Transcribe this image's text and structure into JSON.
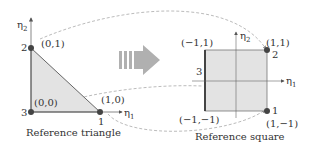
{
  "triangle": {
    "caption": "Reference triangle",
    "axis_x": "η",
    "axis_x_sub": "1",
    "axis_y": "η",
    "axis_y_sub": "2",
    "nodes": [
      {
        "id": "1",
        "coord": "(1,0)"
      },
      {
        "id": "2",
        "coord": "(0,1)"
      },
      {
        "id": "3",
        "coord": "(0,0)"
      }
    ]
  },
  "square": {
    "caption": "Reference square",
    "axis_x": "η",
    "axis_x_sub": "1",
    "axis_y": "η",
    "axis_y_sub": "2",
    "nodes": [
      {
        "id": "1",
        "coord": "(1,−1)"
      },
      {
        "id": "2",
        "coord": "(1,1)"
      },
      {
        "id": "3",
        "coord": ""
      }
    ],
    "corners": {
      "top_left": "(−1,1)",
      "bottom_left": "(−1,−1)"
    }
  },
  "colors": {
    "fill": "#e3e3e3",
    "edge": "#555555",
    "node": "#444444",
    "arrow": "#b0b0b0",
    "dash": "#aaaaaa"
  }
}
